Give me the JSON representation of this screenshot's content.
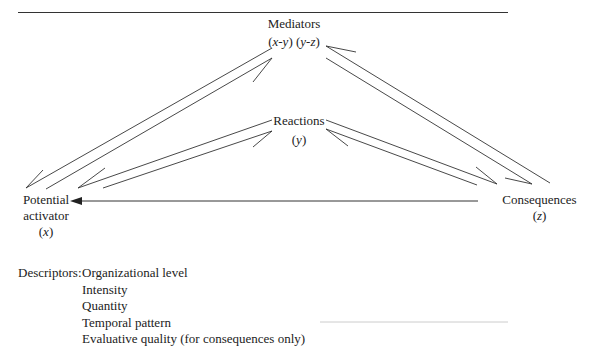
{
  "nodes": {
    "mediators": {
      "title": "Mediators",
      "sub_pre": "(",
      "sub_x": "x",
      "sub_mid1": "-",
      "sub_y": "y",
      "sub_mid2": ") (",
      "sub_y2": "y",
      "sub_mid3": "-",
      "sub_z": "z",
      "sub_post": ")"
    },
    "reactions": {
      "title": "Reactions",
      "sub_pre": "(",
      "sub_var": "y",
      "sub_post": ")"
    },
    "potential_activator": {
      "line1": "Potential",
      "line2": "activator",
      "sub_pre": "(",
      "sub_var": "x",
      "sub_post": ")"
    },
    "consequences": {
      "title": "Consequences",
      "sub_pre": "(",
      "sub_var": "z",
      "sub_post": ")"
    }
  },
  "descriptors": {
    "label": "Descriptors:",
    "items": [
      "Organizational level",
      "Intensity",
      "Quantity",
      "Temporal pattern",
      "Evaluative quality (for consequences only)"
    ]
  },
  "colors": {
    "line": "#333333",
    "text": "#222222",
    "background": "#ffffff"
  }
}
